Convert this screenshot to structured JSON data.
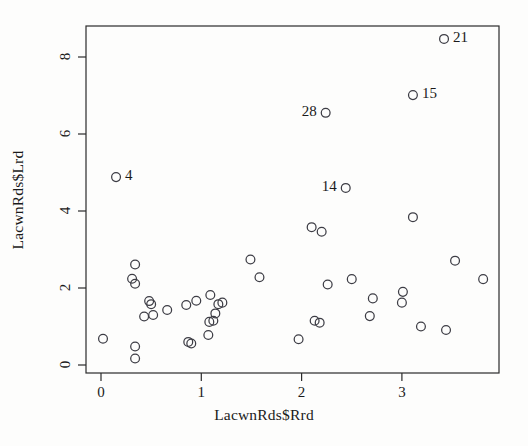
{
  "chart_data": {
    "type": "scatter",
    "title": "",
    "xlabel": "LacwnRds$Rrd",
    "ylabel": "LacwnRds$Lrd",
    "xlim": [
      -0.15,
      4.12
    ],
    "ylim": [
      -0.23,
      9.02
    ],
    "xticks": [
      0,
      1,
      2,
      3
    ],
    "xticklabels": [
      "0",
      "1",
      "2",
      "3"
    ],
    "yticks": [
      0,
      2,
      4,
      6,
      8
    ],
    "yticklabels": [
      "0",
      "2",
      "4",
      "6",
      "8"
    ],
    "grid": false,
    "legend": null,
    "marker": "open-circle",
    "marker_size": 5,
    "points": [
      {
        "x": 0.02,
        "y": 0.68
      },
      {
        "x": 0.15,
        "y": 4.88,
        "label": "4",
        "label_side": "right"
      },
      {
        "x": 0.31,
        "y": 2.24
      },
      {
        "x": 0.34,
        "y": 2.61
      },
      {
        "x": 0.34,
        "y": 2.11
      },
      {
        "x": 0.34,
        "y": 0.48
      },
      {
        "x": 0.34,
        "y": 0.17
      },
      {
        "x": 0.43,
        "y": 1.26
      },
      {
        "x": 0.48,
        "y": 1.66
      },
      {
        "x": 0.5,
        "y": 1.58
      },
      {
        "x": 0.52,
        "y": 1.3
      },
      {
        "x": 0.66,
        "y": 1.43
      },
      {
        "x": 0.85,
        "y": 1.56
      },
      {
        "x": 0.87,
        "y": 0.6
      },
      {
        "x": 0.9,
        "y": 0.56
      },
      {
        "x": 0.95,
        "y": 1.67
      },
      {
        "x": 1.07,
        "y": 0.78
      },
      {
        "x": 1.08,
        "y": 1.12
      },
      {
        "x": 1.09,
        "y": 1.82
      },
      {
        "x": 1.12,
        "y": 1.15
      },
      {
        "x": 1.14,
        "y": 1.34
      },
      {
        "x": 1.17,
        "y": 1.58
      },
      {
        "x": 1.21,
        "y": 1.62
      },
      {
        "x": 1.49,
        "y": 2.74
      },
      {
        "x": 1.58,
        "y": 2.28
      },
      {
        "x": 1.97,
        "y": 0.67
      },
      {
        "x": 2.1,
        "y": 3.58
      },
      {
        "x": 2.2,
        "y": 3.46
      },
      {
        "x": 2.13,
        "y": 1.15
      },
      {
        "x": 2.18,
        "y": 1.1
      },
      {
        "x": 2.24,
        "y": 6.55,
        "label": "28",
        "label_side": "left"
      },
      {
        "x": 2.26,
        "y": 2.09
      },
      {
        "x": 2.44,
        "y": 4.6,
        "label": "14",
        "label_side": "left"
      },
      {
        "x": 2.5,
        "y": 2.23
      },
      {
        "x": 2.68,
        "y": 1.27
      },
      {
        "x": 2.71,
        "y": 1.73
      },
      {
        "x": 3.0,
        "y": 1.62
      },
      {
        "x": 3.01,
        "y": 1.9
      },
      {
        "x": 3.11,
        "y": 3.84
      },
      {
        "x": 3.11,
        "y": 7.01,
        "label": "15",
        "label_side": "right"
      },
      {
        "x": 3.19,
        "y": 1.0
      },
      {
        "x": 3.42,
        "y": 8.47,
        "label": "21",
        "label_side": "right"
      },
      {
        "x": 3.44,
        "y": 0.91
      },
      {
        "x": 3.53,
        "y": 2.71
      },
      {
        "x": 3.81,
        "y": 2.23
      }
    ],
    "colors": {
      "marker_stroke": "#3d3d45",
      "axis": "#2b2b2b",
      "text": "#1a1a1a",
      "background": "#fdfdfc"
    }
  }
}
